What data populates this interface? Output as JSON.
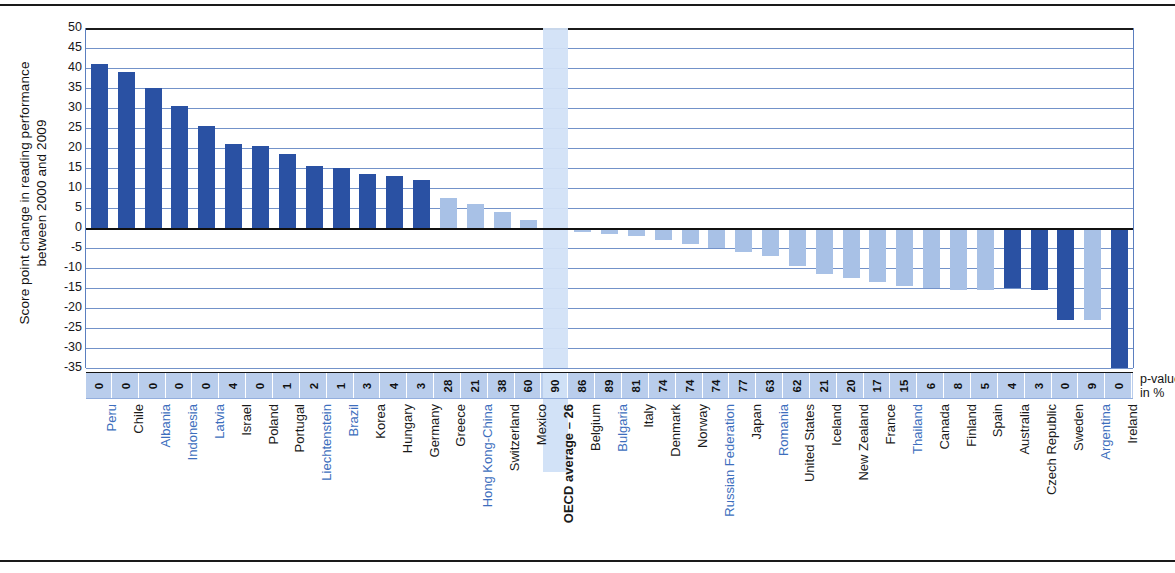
{
  "axis": {
    "ylabel_line1": "Score point change in reading performance",
    "ylabel_line2": "between 2000 and 2009",
    "yticks": [
      "50",
      "45",
      "40",
      "35",
      "30",
      "25",
      "20",
      "15",
      "10",
      "5",
      "0",
      "-5",
      "-10",
      "-15",
      "-20",
      "-25",
      "-30",
      "-35"
    ],
    "ymin": -35,
    "ymax": 50
  },
  "pvalue_note_line1": "p-value",
  "pvalue_note_line2": "in %",
  "colors": {
    "significant_bar": "#2a51a3",
    "non_significant_bar": "#a8c1e6",
    "highlight_band": "#d2e2f7",
    "pvalue_band": "#b9cdec",
    "gridline": "#5b7fc0",
    "label_blue": "#3d6ebd",
    "label_black": "#1a1a1a"
  },
  "chart_data": {
    "type": "bar",
    "title": "",
    "xlabel": "",
    "ylabel": "Score point change in reading performance between 2000 and 2009",
    "ylim": [
      -35,
      50
    ],
    "grid": true,
    "legend": "none",
    "categories": [
      "Peru",
      "Chile",
      "Albania",
      "Indonesia",
      "Latvia",
      "Israel",
      "Poland",
      "Portugal",
      "Liechtenstein",
      "Brazil",
      "Korea",
      "Hungary",
      "Germany",
      "Greece",
      "Hong Kong-China",
      "Switzerland",
      "Mexico",
      "OECD average – 26",
      "Belgium",
      "Bulgaria",
      "Italy",
      "Denmark",
      "Norway",
      "Russian Federation",
      "Japan",
      "Romania",
      "United States",
      "Iceland",
      "New Zealand",
      "France",
      "Thailand",
      "Canada",
      "Finland",
      "Spain",
      "Australia",
      "Czech Republic",
      "Sweden",
      "Argentina",
      "Ireland"
    ],
    "values": [
      41,
      39,
      35,
      30.5,
      25.5,
      21,
      20.5,
      18.5,
      15.5,
      15,
      13.5,
      13,
      12,
      7.5,
      6,
      4,
      2,
      -0.5,
      -1,
      -1.5,
      -2,
      -3,
      -4,
      -5,
      -6,
      -7,
      -9.5,
      -11.5,
      -12.5,
      -13.5,
      -14.5,
      -15,
      -15.5,
      -15.5,
      -15,
      -15.5,
      -23,
      -23,
      -35
    ],
    "pvalues": [
      "0",
      "0",
      "0",
      "0",
      "0",
      "4",
      "0",
      "1",
      "2",
      "1",
      "3",
      "4",
      "3",
      "28",
      "21",
      "38",
      "60",
      "90",
      "86",
      "89",
      "81",
      "74",
      "74",
      "74",
      "77",
      "63",
      "62",
      "21",
      "20",
      "17",
      "15",
      "6",
      "8",
      "5",
      "4",
      "3",
      "0",
      "9",
      "0"
    ],
    "significant": [
      true,
      true,
      true,
      true,
      true,
      true,
      true,
      true,
      true,
      true,
      true,
      true,
      true,
      false,
      false,
      false,
      false,
      false,
      false,
      false,
      false,
      false,
      false,
      false,
      false,
      false,
      false,
      false,
      false,
      false,
      false,
      false,
      false,
      false,
      true,
      true,
      true,
      false,
      true
    ],
    "label_blue": [
      true,
      false,
      true,
      true,
      true,
      false,
      false,
      false,
      true,
      true,
      false,
      false,
      false,
      false,
      true,
      false,
      false,
      false,
      false,
      true,
      false,
      false,
      false,
      true,
      false,
      true,
      false,
      false,
      false,
      false,
      true,
      false,
      false,
      false,
      false,
      false,
      false,
      true,
      false
    ],
    "highlight_index": 17,
    "pvalue_axis_label": "p-value in %"
  }
}
